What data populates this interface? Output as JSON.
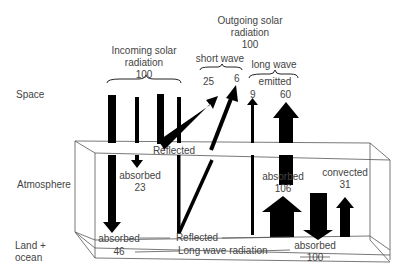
{
  "diagram": {
    "type": "energy-balance",
    "zones": {
      "space": "Space",
      "atmosphere": "Atmosphere",
      "surface_line1": "Land +",
      "surface_line2": "ocean"
    },
    "incoming": {
      "title_line1": "Incoming solar",
      "title_line2": "radiation",
      "value": "100"
    },
    "outgoing": {
      "title_line1": "Outgoing solar",
      "title_line2": "radiation",
      "value": "100",
      "short_wave": {
        "label": "short wave",
        "values": [
          "25",
          "6"
        ]
      },
      "long_wave": {
        "label": "long wave",
        "sublabel": "emitted",
        "values": [
          "9",
          "60"
        ]
      }
    },
    "atmosphere_labels": {
      "reflected_top": "Reflected",
      "absorbed_atm_label": "absorbed",
      "absorbed_atm_value": "23",
      "absorbed_lw_label": "absorbed",
      "absorbed_lw_value": "106",
      "convected_label": "convected",
      "convected_value": "31"
    },
    "surface_labels": {
      "absorbed_label": "absorbed",
      "absorbed_value": "46",
      "reflected": "Reflected",
      "long_wave_radiation": "Long wave radiation",
      "absorbed_back_label": "absorbed",
      "absorbed_back_value": "100"
    },
    "colors": {
      "ink": "#000000",
      "text": "#444444",
      "line": "#555555"
    }
  }
}
